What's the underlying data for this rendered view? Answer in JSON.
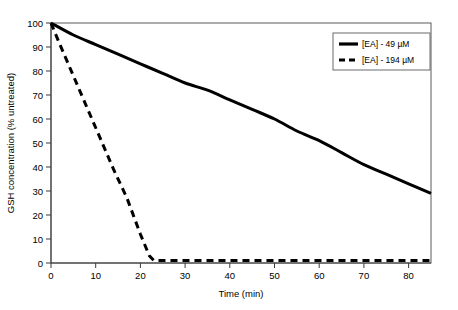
{
  "chart_data": {
    "type": "line",
    "title": "",
    "xlabel": "Time (min)",
    "ylabel": "GSH concentration (% untreated)",
    "xlim": [
      0,
      85
    ],
    "ylim": [
      0,
      100
    ],
    "xticks": [
      0,
      10,
      20,
      30,
      40,
      50,
      60,
      70,
      80
    ],
    "xtick_labels": [
      "0",
      "10",
      "20",
      "30",
      "40",
      "50",
      "60",
      "70",
      "80"
    ],
    "yticks": [
      0,
      10,
      20,
      30,
      40,
      50,
      60,
      70,
      80,
      90,
      100
    ],
    "ytick_labels": [
      "0",
      "10",
      "20",
      "30",
      "40",
      "50",
      "60",
      "70",
      "80",
      "90",
      "100"
    ],
    "grid": false,
    "legend_position": "top-right",
    "series": [
      {
        "name": "[EA] - 49 µM",
        "style": "solid",
        "color": "#000000",
        "x": [
          0,
          5,
          10,
          15,
          20,
          25,
          30,
          35,
          40,
          45,
          50,
          55,
          60,
          65,
          70,
          75,
          80,
          85
        ],
        "values": [
          100,
          95,
          91,
          87,
          83,
          79,
          75,
          72,
          68,
          64,
          60,
          55,
          51,
          46,
          41,
          37,
          33,
          29
        ]
      },
      {
        "name": "[EA] - 194 µM",
        "style": "dashed",
        "color": "#000000",
        "x": [
          0,
          2,
          5,
          8,
          11,
          14,
          17,
          20,
          22,
          23,
          30,
          40,
          50,
          60,
          70,
          80,
          85
        ],
        "values": [
          100,
          91,
          78,
          65,
          52,
          39,
          27,
          12,
          3,
          1,
          1,
          1,
          1,
          1,
          1,
          1,
          1
        ]
      }
    ],
    "legend": [
      {
        "label": "[EA] - 49 µM",
        "style": "solid"
      },
      {
        "label": "[EA] - 194 µM",
        "style": "dashed"
      }
    ]
  }
}
